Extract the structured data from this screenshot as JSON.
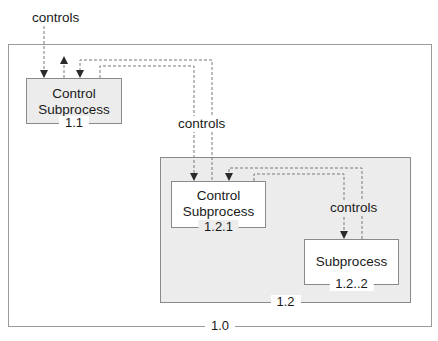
{
  "diagram": {
    "outer": {
      "number": "1.0"
    },
    "box_1_1": {
      "title_line1": "Control",
      "title_line2": "Subprocess",
      "number": "1.1"
    },
    "box_1_2": {
      "number": "1.2"
    },
    "box_1_2_1": {
      "title_line1": "Control",
      "title_line2": "Subprocess",
      "number": "1.2.1"
    },
    "box_1_2_2": {
      "title": "Subprocess",
      "number": "1.2..2"
    },
    "labels": {
      "top": "controls",
      "middle": "controls",
      "inner": "controls"
    },
    "colors": {
      "shaded_fill": "#ececec",
      "border": "#8a8a8a",
      "wire": "#7a7a7a"
    }
  }
}
